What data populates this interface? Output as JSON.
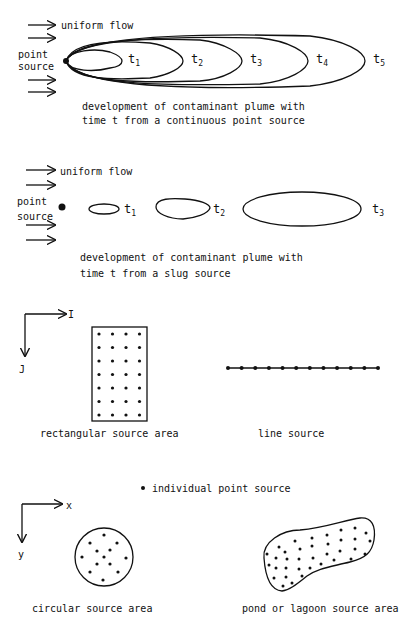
{
  "panel_continuous": {
    "flow_label": "uniform flow",
    "source_label_line1": "point",
    "source_label_line2": "source",
    "time_labels": [
      "t",
      "t",
      "t",
      "t",
      "t"
    ],
    "time_subscripts": [
      "1",
      "2",
      "3",
      "4",
      "5"
    ],
    "caption_line1": "development of contaminant plume with",
    "caption_line2": "time t from a continuous point source"
  },
  "panel_slug": {
    "flow_label": "uniform flow",
    "source_label_line1": "point",
    "source_label_line2": "source",
    "time_labels": [
      "t",
      "t",
      "t"
    ],
    "time_subscripts": [
      "1",
      "2",
      "3"
    ],
    "caption_line1": "development of contaminant plume with",
    "caption_line2": "time t from a slug source"
  },
  "panel_rect_line": {
    "axis_x_label": "I",
    "axis_y_label": "J",
    "rect_caption": "rectangular source area",
    "line_caption": "line source",
    "rect_grid": {
      "columns": 4,
      "rows": 7
    },
    "line_dot_count": 12
  },
  "legend": {
    "point_source_label": "individual point source"
  },
  "panel_circle_pond": {
    "axis_x_label": "x",
    "axis_y_label": "y",
    "circle_caption": "circular source area",
    "pond_caption": "pond or lagoon source area"
  }
}
